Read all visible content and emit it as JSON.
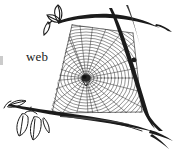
{
  "figure": {
    "kind": "line-art-illustration",
    "background_color": "#ffffff",
    "ink_color": "#1b1b1b",
    "web_line_color": "#3a3a3a",
    "width": 174,
    "height": 151
  },
  "labels": {
    "web": "web"
  },
  "parts": {
    "web_name": "orb-web",
    "hub_name": "web-hub",
    "upper_branch_name": "upper-branch",
    "right_branch_name": "right-branch",
    "lower_branch_name": "lower-branch",
    "top_leaf_cluster_name": "top-leaf-cluster",
    "bottom_leaf_cluster_name": "bottom-leaf-cluster",
    "left_leaf_name": "left-tip-leaf"
  },
  "web_geometry": {
    "hub_x": 86,
    "hub_y": 78,
    "radial_count": 26,
    "spiral_ring_count": 22,
    "anchor_points": [
      [
        72,
        26
      ],
      [
        132,
        34
      ],
      [
        140,
        112
      ],
      [
        52,
        112
      ]
    ]
  }
}
